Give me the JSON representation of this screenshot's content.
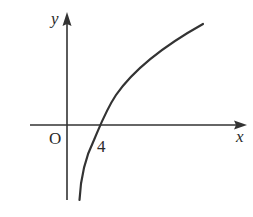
{
  "diagram": {
    "type": "function-graph",
    "axes": {
      "x_label": "x",
      "y_label": "y",
      "origin_label": "O"
    },
    "tick_labels": [
      {
        "label": "4",
        "position": "x-intercept of curve"
      }
    ],
    "curve": {
      "shape": "logarithmic",
      "x_intercept": 4,
      "monotonic": "increasing",
      "asymptote": "vertical, between origin and x = 4"
    },
    "colors": {
      "stroke": "#333333",
      "background": "#ffffff"
    }
  }
}
